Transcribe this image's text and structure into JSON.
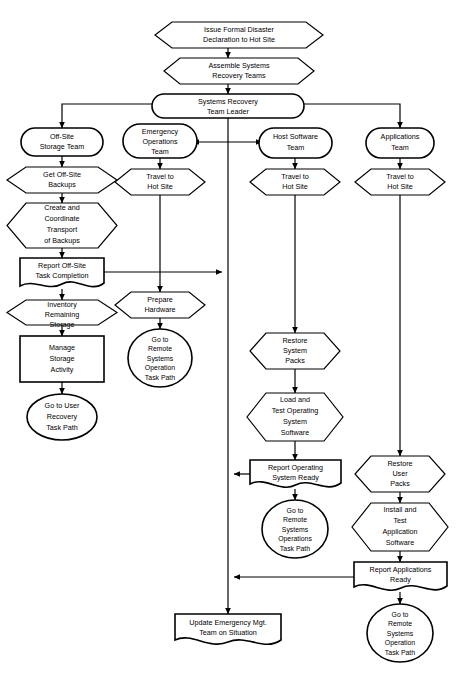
{
  "diagram": {
    "background": "#ffffff",
    "line_color": "#000000",
    "fill_color": "#ffffff"
  },
  "nodes": {
    "issue_declaration": {
      "label_lines": [
        "Issue Formal Disaster",
        "Declaration to Hot Site"
      ],
      "shape": "hexagon"
    },
    "assemble_teams": {
      "label_lines": [
        "Assemble Systems",
        "Recovery Teams"
      ],
      "shape": "hexagon"
    },
    "team_leader": {
      "label_lines": [
        "Systems Recovery",
        "Team Leader"
      ],
      "shape": "stadium"
    },
    "offsite_storage_team": {
      "label_lines": [
        "Off-Site",
        "Storage Team"
      ],
      "shape": "stadium"
    },
    "get_offsite_backups": {
      "label_lines": [
        "Get Off-Site",
        "Backups"
      ],
      "shape": "hexagon"
    },
    "create_coordinate_transport": {
      "label_lines": [
        "Create and",
        "Coordinate",
        "Transport",
        "of Backups"
      ],
      "shape": "hexagon"
    },
    "report_offsite_task_completion": {
      "label_lines": [
        "Report Off-Site",
        "Task Completion"
      ],
      "shape": "document"
    },
    "inventory_remaining_storage": {
      "label_lines": [
        "Inventory",
        "Remaining",
        "Storage"
      ],
      "shape": "hexagon"
    },
    "manage_storage_activity": {
      "label_lines": [
        "Manage",
        "Storage",
        "Activity"
      ],
      "shape": "rect"
    },
    "go_to_user_recovery": {
      "label_lines": [
        "Go to User",
        "Recovery",
        "Task Path"
      ],
      "shape": "ellipse"
    },
    "emergency_operations_team": {
      "label_lines": [
        "Emergency",
        "Operations",
        "Team"
      ],
      "shape": "stadium"
    },
    "eo_travel_hot_site": {
      "label_lines": [
        "Travel to",
        "Hot Site"
      ],
      "shape": "hexagon"
    },
    "prepare_hardware": {
      "label_lines": [
        "Prepare",
        "Hardware"
      ],
      "shape": "hexagon"
    },
    "eo_go_to_remote": {
      "label_lines": [
        "Go to",
        "Remote",
        "Systems",
        "Operation",
        "Task Path"
      ],
      "shape": "ellipse"
    },
    "host_software_team": {
      "label_lines": [
        "Host Software",
        "Team"
      ],
      "shape": "stadium"
    },
    "hs_travel_hot_site": {
      "label_lines": [
        "Travel to",
        "Hot Site"
      ],
      "shape": "hexagon"
    },
    "restore_system_packs": {
      "label_lines": [
        "Restore",
        "System",
        "Packs"
      ],
      "shape": "hexagon"
    },
    "load_test_os_software": {
      "label_lines": [
        "Load and",
        "Test Operating",
        "System",
        "Software"
      ],
      "shape": "hexagon"
    },
    "report_os_ready": {
      "label_lines": [
        "Report Operating",
        "System Ready"
      ],
      "shape": "document"
    },
    "hs_go_to_remote": {
      "label_lines": [
        "Go to",
        "Remote",
        "Systems",
        "Operations",
        "Task Path"
      ],
      "shape": "ellipse"
    },
    "applications_team": {
      "label_lines": [
        "Applications",
        "Team"
      ],
      "shape": "stadium"
    },
    "app_travel_hot_site": {
      "label_lines": [
        "Travel to",
        "Hot Site"
      ],
      "shape": "hexagon"
    },
    "restore_user_packs": {
      "label_lines": [
        "Restore",
        "User",
        "Packs"
      ],
      "shape": "hexagon"
    },
    "install_test_app_software": {
      "label_lines": [
        "Install and",
        "Test",
        "Application",
        "Software"
      ],
      "shape": "hexagon"
    },
    "report_applications_ready": {
      "label_lines": [
        "Report Applications",
        "Ready"
      ],
      "shape": "document"
    },
    "app_go_to_remote": {
      "label_lines": [
        "Go to",
        "Remote",
        "Systems",
        "Operation",
        "Task Path"
      ],
      "shape": "ellipse"
    },
    "update_emergency_mgt": {
      "label_lines": [
        "Update Emergency Mgt.",
        "Team on Situation"
      ],
      "shape": "document"
    }
  }
}
